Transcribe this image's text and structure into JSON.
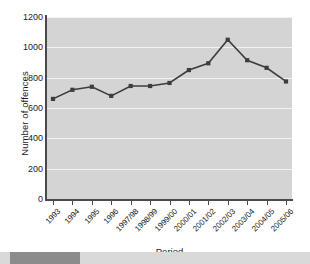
{
  "chart_data": {
    "type": "line",
    "title": "",
    "xlabel": "Period",
    "ylabel": "Number of offences",
    "categories": [
      "1993",
      "1994",
      "1995",
      "1996",
      "1997/98",
      "1998/99",
      "1999/00",
      "2000/01",
      "2001/02",
      "2002/03",
      "2003/04",
      "2004/05",
      "2005/06"
    ],
    "values": [
      660,
      720,
      740,
      680,
      745,
      745,
      765,
      850,
      895,
      1050,
      915,
      865,
      775
    ],
    "ylim": [
      0,
      1200
    ],
    "yticks": [
      0,
      200,
      400,
      600,
      800,
      1000,
      1200
    ],
    "ytick_labels": [
      "0",
      "200",
      "400",
      "600",
      "800",
      "1000",
      "1200"
    ],
    "grid": true,
    "legend": null,
    "series_color": "#3d3d3d",
    "marker": "square",
    "plot_background": "#d4d4d4",
    "gridline_color": "#f2f2f2"
  },
  "figure": {
    "xlabel": "Period",
    "ylabel": "Number of offences"
  }
}
